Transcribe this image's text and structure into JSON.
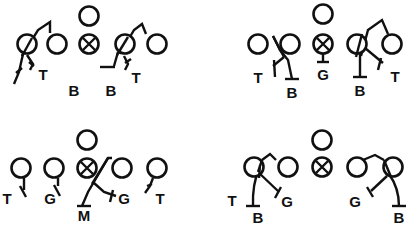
{
  "colors": {
    "ink": "#111111",
    "background": "#ffffff"
  },
  "diagrams": [
    {
      "id": "top-left",
      "offensive_players": [
        {
          "x": 27,
          "y": 44,
          "type": "circle"
        },
        {
          "x": 57,
          "y": 44,
          "type": "circle"
        },
        {
          "x": 89,
          "y": 44,
          "type": "center-x"
        },
        {
          "x": 89,
          "y": 16,
          "type": "circle"
        },
        {
          "x": 125,
          "y": 44,
          "type": "circle"
        },
        {
          "x": 157,
          "y": 44,
          "type": "circle"
        }
      ],
      "labels": [
        {
          "text": "T",
          "x": 43,
          "y": 80
        },
        {
          "text": "B",
          "x": 74,
          "y": 96
        },
        {
          "text": "B",
          "x": 111,
          "y": 96
        },
        {
          "text": "T",
          "x": 136,
          "y": 83
        }
      ]
    },
    {
      "id": "top-right",
      "offensive_players": [
        {
          "x": 258,
          "y": 44,
          "type": "circle"
        },
        {
          "x": 290,
          "y": 44,
          "type": "circle"
        },
        {
          "x": 323,
          "y": 44,
          "type": "center-x"
        },
        {
          "x": 323,
          "y": 14,
          "type": "circle"
        },
        {
          "x": 357,
          "y": 44,
          "type": "circle"
        },
        {
          "x": 392,
          "y": 44,
          "type": "circle"
        }
      ],
      "labels": [
        {
          "text": "T",
          "x": 258,
          "y": 83
        },
        {
          "text": "B",
          "x": 292,
          "y": 98
        },
        {
          "text": "G",
          "x": 323,
          "y": 80
        },
        {
          "text": "B",
          "x": 360,
          "y": 96
        },
        {
          "text": "T",
          "x": 395,
          "y": 82
        }
      ]
    },
    {
      "id": "bottom-left",
      "offensive_players": [
        {
          "x": 21,
          "y": 168,
          "type": "circle"
        },
        {
          "x": 54,
          "y": 168,
          "type": "circle"
        },
        {
          "x": 87,
          "y": 168,
          "type": "center-x"
        },
        {
          "x": 87,
          "y": 140,
          "type": "circle"
        },
        {
          "x": 122,
          "y": 168,
          "type": "circle"
        },
        {
          "x": 157,
          "y": 168,
          "type": "circle"
        }
      ],
      "labels": [
        {
          "text": "T",
          "x": 7,
          "y": 204
        },
        {
          "text": "G",
          "x": 50,
          "y": 204
        },
        {
          "text": "M",
          "x": 84,
          "y": 221
        },
        {
          "text": "G",
          "x": 124,
          "y": 204
        },
        {
          "text": "T",
          "x": 160,
          "y": 204
        }
      ]
    },
    {
      "id": "bottom-right",
      "offensive_players": [
        {
          "x": 254,
          "y": 167,
          "type": "circle"
        },
        {
          "x": 288,
          "y": 167,
          "type": "circle"
        },
        {
          "x": 322,
          "y": 167,
          "type": "center-x"
        },
        {
          "x": 322,
          "y": 140,
          "type": "circle"
        },
        {
          "x": 357,
          "y": 167,
          "type": "circle"
        },
        {
          "x": 393,
          "y": 167,
          "type": "circle"
        }
      ],
      "labels": [
        {
          "text": "T",
          "x": 232,
          "y": 206
        },
        {
          "text": "B",
          "x": 258,
          "y": 223
        },
        {
          "text": "G",
          "x": 287,
          "y": 207
        },
        {
          "text": "G",
          "x": 355,
          "y": 207
        },
        {
          "text": "B",
          "x": 399,
          "y": 223
        }
      ]
    }
  ]
}
